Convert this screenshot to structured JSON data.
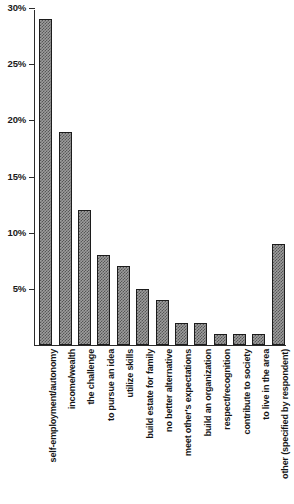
{
  "chart_data": {
    "type": "bar",
    "title": "",
    "subtitle": "",
    "xlabel": "",
    "ylabel": "",
    "ylim": [
      0,
      30
    ],
    "ytick_labels": [
      "5%",
      "10%",
      "15%",
      "20%",
      "25%",
      "30%"
    ],
    "ytick_values": [
      5,
      10,
      15,
      20,
      25,
      30
    ],
    "grid": false,
    "legend": null,
    "bar_color": "#9d9d9d",
    "bar_edge_color": "#1c1c1c",
    "bar_fill_pattern": "hatched-gray",
    "axis_color": "#2b2b2b",
    "value_unit": "percent",
    "categories": [
      "self-employment/autonomy",
      "income/wealth",
      "the challenge",
      "to pursue an idea",
      "utilize skills",
      "build estate for family",
      "no better alternative",
      "meet other's expectations",
      "build an organization",
      "respect/recognition",
      "contribute to society",
      "to live in the area",
      "other (specified by respondent)"
    ],
    "values": [
      29,
      19,
      12,
      8,
      7,
      5,
      4,
      2,
      2,
      1,
      1,
      1,
      9
    ]
  }
}
